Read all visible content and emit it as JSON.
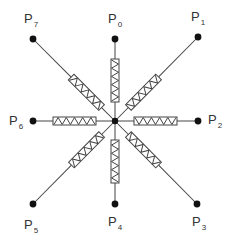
{
  "diagram": {
    "title": "",
    "center": {
      "x": 115,
      "y": 121
    },
    "line_color": "#444444",
    "node_color": "#111111",
    "resistor_fill": "#ffffff",
    "nodes": [
      {
        "id": "P0",
        "label": "P",
        "sub": "0",
        "x": 115,
        "y": 39,
        "lx": 108,
        "ly": 12
      },
      {
        "id": "P1",
        "label": "P",
        "sub": "1",
        "x": 198,
        "y": 37,
        "lx": 191,
        "ly": 10
      },
      {
        "id": "P2",
        "label": "P",
        "sub": "2",
        "x": 198,
        "y": 121,
        "lx": 208,
        "ly": 113
      },
      {
        "id": "P3",
        "label": "P",
        "sub": "3",
        "x": 197,
        "y": 204,
        "lx": 192,
        "ly": 215
      },
      {
        "id": "P4",
        "label": "P",
        "sub": "4",
        "x": 115,
        "y": 204,
        "lx": 108,
        "ly": 215
      },
      {
        "id": "P5",
        "label": "P",
        "sub": "5",
        "x": 33,
        "y": 204,
        "lx": 24,
        "ly": 218
      },
      {
        "id": "P6",
        "label": "P",
        "sub": "6",
        "x": 33,
        "y": 121,
        "lx": 9,
        "ly": 114
      },
      {
        "id": "P7",
        "label": "P",
        "sub": "7",
        "x": 33,
        "y": 39,
        "lx": 24,
        "ly": 12
      }
    ],
    "connections": [
      {
        "from": "center",
        "to": "P0",
        "element": "resistor"
      },
      {
        "from": "center",
        "to": "P1",
        "element": "resistor"
      },
      {
        "from": "center",
        "to": "P2",
        "element": "resistor"
      },
      {
        "from": "center",
        "to": "P3",
        "element": "resistor"
      },
      {
        "from": "center",
        "to": "P4",
        "element": "resistor"
      },
      {
        "from": "center",
        "to": "P5",
        "element": "resistor"
      },
      {
        "from": "center",
        "to": "P6",
        "element": "resistor"
      },
      {
        "from": "center",
        "to": "P7",
        "element": "resistor"
      }
    ],
    "resistor": {
      "start": 19,
      "end": 62,
      "width": 8,
      "zigzags": 5
    }
  }
}
